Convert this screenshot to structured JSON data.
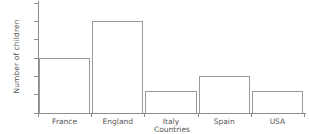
{
  "chart_data": {
    "type": "bar",
    "title": "",
    "xlabel": "Countries",
    "ylabel": "Number of children",
    "categories": [
      "France",
      "England",
      "Italy",
      "Spain",
      "USA"
    ],
    "values": [
      15,
      25,
      6,
      10,
      6
    ],
    "ylim": [
      0,
      30
    ],
    "yticks": [
      0,
      5,
      10,
      15,
      20,
      25,
      30
    ],
    "ytick_labels": [
      "0",
      "5",
      "10",
      "15",
      "20",
      "25",
      "30"
    ],
    "grid": false,
    "legend": false,
    "bar_face_color": "#ffffff",
    "bar_edge_color": "#9a9a9a",
    "axis_color": "#8d8d8d",
    "text_color": "#555555",
    "background_color": "#ffffff"
  }
}
